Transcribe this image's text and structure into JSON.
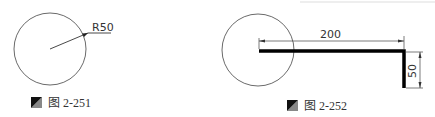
{
  "figures": [
    {
      "id": "fig-2-251",
      "caption": "图 2-251",
      "circle": {
        "cx": 50,
        "cy": 49,
        "r": 36
      },
      "dimension": {
        "label": "R50",
        "type": "radius"
      }
    },
    {
      "id": "fig-2-252",
      "caption": "图 2-252",
      "circle": {
        "cx": 258,
        "cy": 50,
        "r": 36
      },
      "dimensions": [
        {
          "label": "200",
          "type": "horizontal"
        },
        {
          "label": "50",
          "type": "vertical"
        }
      ]
    }
  ],
  "colors": {
    "line": "#000000",
    "thin": "#444444",
    "background": "#ffffff"
  }
}
